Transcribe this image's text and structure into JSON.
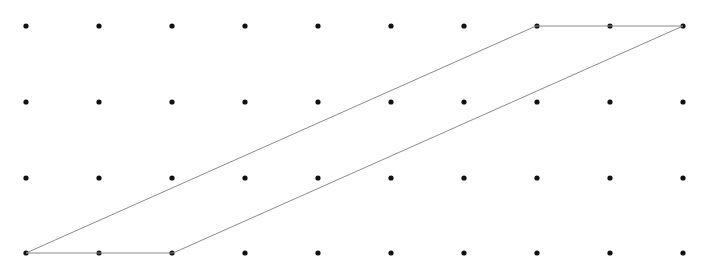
{
  "figure": {
    "background_color": "#ffffff",
    "width": 712,
    "height": 275
  },
  "lattice": {
    "name": "dot-grid",
    "columns": 10,
    "rows": 4,
    "origin_x": 26,
    "origin_y": 26,
    "spacing_x": 73.0,
    "spacing_y": 75.7,
    "dot_radius": 2.6,
    "dot_color": "#111111",
    "column_x": [
      26,
      99,
      172,
      245,
      318,
      391,
      464,
      537,
      610,
      683
    ],
    "row_y": [
      26,
      102,
      178,
      253
    ]
  },
  "shape": {
    "name": "parallelogram",
    "type": "polygon",
    "stroke_color": "#8a8a8a",
    "stroke_width": 1,
    "fill": "none",
    "vertices": [
      {
        "label": "bottom-left",
        "x": 26,
        "y": 253,
        "grid_col": 0,
        "grid_row": 3
      },
      {
        "label": "bottom-right",
        "x": 173,
        "y": 253,
        "grid_col": 2,
        "grid_row": 3
      },
      {
        "label": "top-right",
        "x": 683,
        "y": 26,
        "grid_col": 9,
        "grid_row": 0
      },
      {
        "label": "top-left",
        "x": 536,
        "y": 26,
        "grid_col": 7,
        "grid_row": 0
      }
    ],
    "edges": [
      {
        "name": "bottom-edge",
        "from": "bottom-left",
        "to": "bottom-right"
      },
      {
        "name": "right-diagonal-edge",
        "from": "bottom-right",
        "to": "top-right"
      },
      {
        "name": "top-edge",
        "from": "top-right",
        "to": "top-left"
      },
      {
        "name": "left-diagonal-edge",
        "from": "top-left",
        "to": "bottom-left"
      }
    ],
    "base_units": 2,
    "height_units": 3
  }
}
